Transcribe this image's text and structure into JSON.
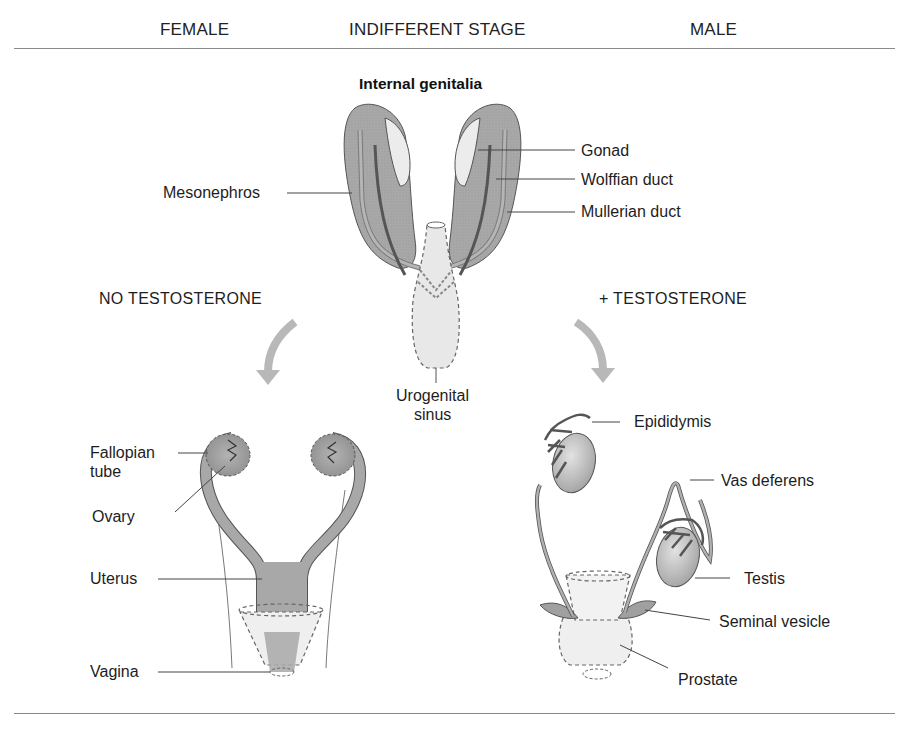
{
  "header": {
    "female": "FEMALE",
    "indifferent": "INDIFFERENT STAGE",
    "male": "MALE"
  },
  "indifferent_stage": {
    "subtitle": "Internal genitalia",
    "labels": {
      "mesonephros": "Mesonephros",
      "gonad": "Gonad",
      "wolffian_duct": "Wolffian duct",
      "mullerian_duct": "Mullerian duct",
      "urogenital_sinus_line1": "Urogenital",
      "urogenital_sinus_line2": "sinus"
    }
  },
  "conditions": {
    "female": "NO TESTOSTERONE",
    "male": "+ TESTOSTERONE"
  },
  "female": {
    "labels": {
      "fallopian_line1": "Fallopian",
      "fallopian_line2": "tube",
      "ovary": "Ovary",
      "uterus": "Uterus",
      "vagina": "Vagina"
    }
  },
  "male": {
    "labels": {
      "epididymis": "Epididymis",
      "vas_deferens": "Vas deferens",
      "testis": "Testis",
      "seminal_vesicle": "Seminal vesicle",
      "prostate": "Prostate"
    }
  },
  "colors": {
    "tissue_dark": "#a9a9a9",
    "tissue_light": "#e6e6e6",
    "duct": "#6a6a6a",
    "arrow": "#b8b8b8",
    "rule": "#8a8a8a"
  }
}
